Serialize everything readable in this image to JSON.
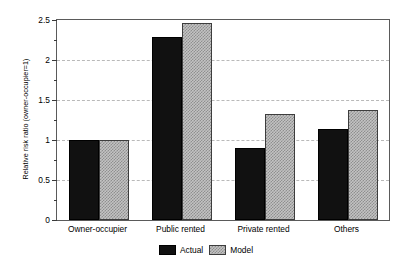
{
  "chart_data": {
    "type": "bar",
    "title": "",
    "subtitle": "",
    "xlabel": "",
    "ylabel": "Relative risk ratio (owner-occupier=1)",
    "categories": [
      "Owner-occupier",
      "Public rented",
      "Private rented",
      "Others"
    ],
    "series": [
      {
        "name": "Actual",
        "color": "#111111",
        "values": [
          1.0,
          2.29,
          0.9,
          1.14
        ]
      },
      {
        "name": "Model",
        "color": "#c3c3c3",
        "values": [
          1.0,
          2.46,
          1.33,
          1.38
        ]
      }
    ],
    "ylim": [
      0,
      2.5
    ],
    "ytick_labels": [
      "0",
      "0.5",
      "1",
      "1.5",
      "2",
      "2.5"
    ],
    "ytick_values": [
      0,
      0.5,
      1,
      1.5,
      2,
      2.5
    ],
    "yminor_tick_values": [
      0.25,
      0.75,
      1.25,
      1.75,
      2.25
    ],
    "gridlines_at": [
      0.5,
      1,
      1.5,
      2
    ],
    "grid": true,
    "grid_style": "dashed",
    "grid_color": "#b9b9b9",
    "legend_position": "bottom-center",
    "legend_entries": [
      "Actual",
      "Model"
    ]
  }
}
